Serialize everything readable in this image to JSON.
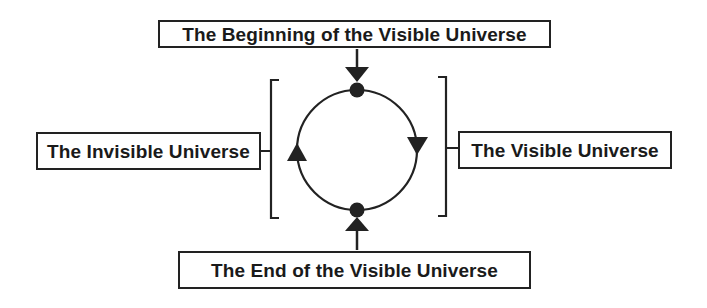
{
  "diagram": {
    "labels": {
      "top": "The Beginning of the Visible Universe",
      "left": "The Invisible Universe",
      "right": "The Visible Universe",
      "bottom": "The End of the Visible Universe"
    },
    "nodes": [
      {
        "id": "beginning",
        "position": "top",
        "shape": "filled-circle"
      },
      {
        "id": "end",
        "position": "bottom",
        "shape": "filled-circle"
      }
    ],
    "cycle": {
      "shape": "circle",
      "direction": "clockwise",
      "arcs": [
        {
          "from": "beginning",
          "to": "end",
          "side": "right",
          "label_ref": "right",
          "arrow": "down-triangle"
        },
        {
          "from": "end",
          "to": "beginning",
          "side": "left",
          "label_ref": "left",
          "arrow": "up-triangle"
        }
      ]
    },
    "connectors": [
      {
        "from": "top-label",
        "to": "beginning",
        "arrow": "down"
      },
      {
        "from": "bottom-label",
        "to": "end",
        "arrow": "up"
      }
    ],
    "brackets": [
      {
        "side": "left",
        "groups": "left-arc",
        "label_ref": "left"
      },
      {
        "side": "right",
        "groups": "right-arc",
        "label_ref": "right"
      }
    ],
    "colors": {
      "stroke": "#222222",
      "background": "#ffffff"
    }
  }
}
